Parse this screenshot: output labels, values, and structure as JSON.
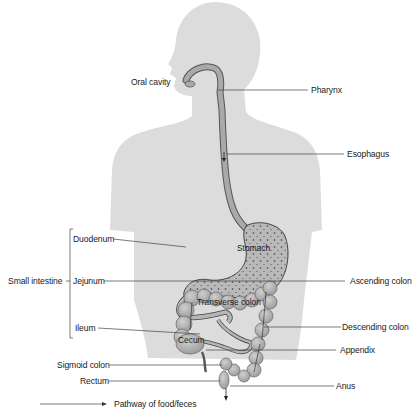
{
  "diagram": {
    "labels": {
      "oral_cavity": "Oral cavity",
      "pharynx": "Pharynx",
      "esophagus": "Esophagus",
      "stomach": "Stomach",
      "duodenum": "Duodenum",
      "small_intestine": "Small intestine",
      "jejunum": "Jejunum",
      "ileum": "Ileum",
      "ascending_colon": "Ascending colon",
      "transverse_colon": "Transverse colon",
      "descending_colon": "Descending colon",
      "cecum": "Cecum",
      "appendix": "Appendix",
      "sigmoid_colon": "Sigmoid colon",
      "rectum": "Rectum",
      "anus": "Anus"
    },
    "legend": {
      "arrow_label": "Pathway of food/feces"
    },
    "colors": {
      "silhouette": "#dcdcdc",
      "organ_fill": "#b4b4b4",
      "organ_stroke": "#555555",
      "leader_line": "#444444",
      "text": "#1a1a1a"
    }
  }
}
